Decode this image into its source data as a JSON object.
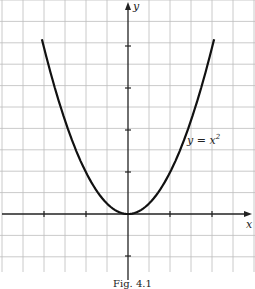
{
  "chart_data": {
    "type": "line",
    "title": "",
    "caption": "Fig. 4.1",
    "xlabel": "x",
    "ylabel": "y",
    "series": [
      {
        "name": "y = x²",
        "function": "y = x^2",
        "x": [
          -2,
          -1.5,
          -1,
          -0.5,
          0,
          0.5,
          1,
          1.5,
          2
        ],
        "values": [
          4,
          2.25,
          1,
          0.25,
          0,
          0.25,
          1,
          2.25,
          4
        ]
      }
    ],
    "xlim": [
      -2.5,
      2.5
    ],
    "ylim": [
      -1,
      4.5
    ],
    "x_ticks": [
      -2,
      -1,
      1,
      2
    ],
    "y_ticks": [
      -1,
      1,
      2,
      3,
      4
    ],
    "grid": true,
    "curve_label": "y = x²",
    "grid_step_units": 0.5
  },
  "labels": {
    "x_axis": "x",
    "y_axis": "y",
    "curve": "y = x",
    "curve_exp": "2",
    "caption": "Fig. 4.1"
  }
}
